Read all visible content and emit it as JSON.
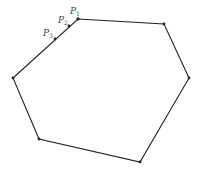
{
  "diagram": {
    "type": "polygon",
    "sides": 6,
    "stroke_color": "#222222",
    "label_color": "#444444",
    "vertices": [
      {
        "x": 78,
        "y": 19
      },
      {
        "x": 164,
        "y": 24
      },
      {
        "x": 189,
        "y": 78
      },
      {
        "x": 140,
        "y": 162
      },
      {
        "x": 39,
        "y": 139
      },
      {
        "x": 13,
        "y": 78
      }
    ],
    "points": [
      {
        "name": "P",
        "sub": "1",
        "x": 78,
        "y": 19,
        "lx": 70,
        "ly": 14
      },
      {
        "name": "P",
        "sub": "2",
        "x": 69,
        "y": 26,
        "lx": 58,
        "ly": 23
      },
      {
        "name": "P",
        "sub": "3",
        "x": 55,
        "y": 39,
        "lx": 43,
        "ly": 36
      }
    ]
  }
}
